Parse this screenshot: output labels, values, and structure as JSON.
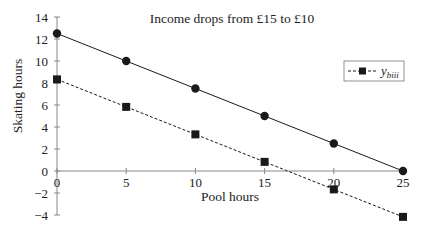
{
  "chart_data": {
    "type": "line",
    "title": "Income drops from £15 to £10",
    "xlabel": "Pool hours",
    "ylabel": "Skating hours",
    "x": [
      0,
      5,
      10,
      15,
      20,
      25
    ],
    "xlim": [
      0,
      25
    ],
    "ylim": [
      -4,
      14
    ],
    "xticks": [
      0,
      5,
      10,
      15,
      20,
      25
    ],
    "yticks": [
      -4,
      -2,
      0,
      2,
      4,
      6,
      8,
      10,
      12,
      14
    ],
    "grid": false,
    "legend_position": "upper right",
    "series": [
      {
        "name": "",
        "style": "solid",
        "marker": "circle",
        "color": "#1a1a1a",
        "values": [
          12.5,
          10,
          7.5,
          5,
          2.5,
          0
        ]
      },
      {
        "name": "y_biii",
        "style": "dashed",
        "marker": "square",
        "color": "#1a1a1a",
        "values": [
          8.33,
          5.83,
          3.33,
          0.83,
          -1.67,
          -4.17
        ]
      }
    ]
  },
  "legend": {
    "label_main": "y",
    "label_sub": "biii"
  },
  "colors": {
    "axis": "#888888",
    "line": "#1a1a1a",
    "text": "#222222"
  }
}
